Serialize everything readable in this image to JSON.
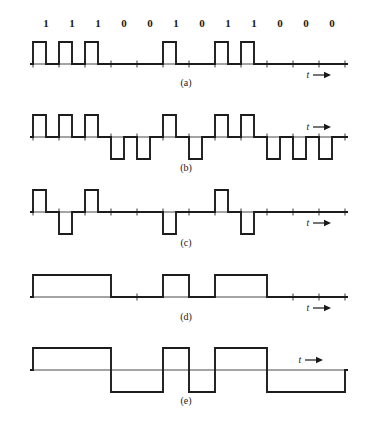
{
  "figure": {
    "background_color": "#ffffff",
    "wave_color": "#1c1c1c",
    "axis_color": "#4a4a4a",
    "text_color": "#1a1a1a",
    "time_axis_label": "t",
    "arrow_glyph": "→"
  },
  "bits": {
    "sequence": [
      "1",
      "1",
      "1",
      "0",
      "0",
      "1",
      "0",
      "1",
      "1",
      "0",
      "0",
      "0"
    ],
    "count": 12,
    "values": [
      1,
      1,
      1,
      0,
      0,
      1,
      0,
      1,
      1,
      0,
      0,
      0
    ]
  },
  "geometry": {
    "axis_x_start": 30,
    "axis_x_end": 348,
    "bit_width": 26,
    "first_bit_left": 33,
    "pulse_amplitude": 22,
    "rz_duty": 0.5
  },
  "panels": [
    {
      "id": "a",
      "caption": "(a)",
      "scheme": "unipolar-rz",
      "baseline_y": 64,
      "caption_y": 86,
      "t_label_x": 308,
      "t_label_y": 78,
      "levels": [
        1,
        1,
        1,
        0,
        0,
        1,
        0,
        1,
        1,
        0,
        0,
        0
      ],
      "description": "Unipolar return-to-zero: each 1 is a half-width positive pulse, each 0 is zero level."
    },
    {
      "id": "b",
      "caption": "(b)",
      "scheme": "polar-rz",
      "baseline_y": 137,
      "caption_y": 171,
      "t_label_x": 308,
      "t_label_y": 130,
      "levels": [
        1,
        1,
        1,
        -1,
        -1,
        1,
        -1,
        1,
        1,
        -1,
        -1,
        -1
      ],
      "description": "Polar return-to-zero: 1 is a half-width positive pulse, 0 is a half-width negative pulse."
    },
    {
      "id": "c",
      "caption": "(c)",
      "scheme": "bipolar-ami-rz",
      "baseline_y": 212,
      "caption_y": 246,
      "t_label_x": 308,
      "t_label_y": 226,
      "levels": [
        1,
        -1,
        1,
        0,
        0,
        -1,
        0,
        1,
        -1,
        0,
        0,
        0
      ],
      "description": "Bipolar AMI return-to-zero: marks alternate in polarity, spaces are zero level."
    },
    {
      "id": "d",
      "caption": "(d)",
      "scheme": "unipolar-nrz",
      "baseline_y": 297,
      "caption_y": 320,
      "t_label_x": 308,
      "t_label_y": 311,
      "levels": [
        1,
        1,
        1,
        0,
        0,
        1,
        0,
        1,
        1,
        0,
        0,
        0
      ],
      "description": "Unipolar non-return-to-zero: 1 holds a full-width positive level, 0 is zero level."
    },
    {
      "id": "e",
      "caption": "(e)",
      "scheme": "polar-nrz",
      "baseline_y": 370,
      "caption_y": 404,
      "t_label_x": 300,
      "t_label_y": 363,
      "levels": [
        1,
        1,
        1,
        -1,
        -1,
        1,
        -1,
        1,
        1,
        -1,
        -1,
        -1
      ],
      "description": "Polar non-return-to-zero: 1 holds a full-width positive level, 0 holds a full-width negative level."
    }
  ]
}
